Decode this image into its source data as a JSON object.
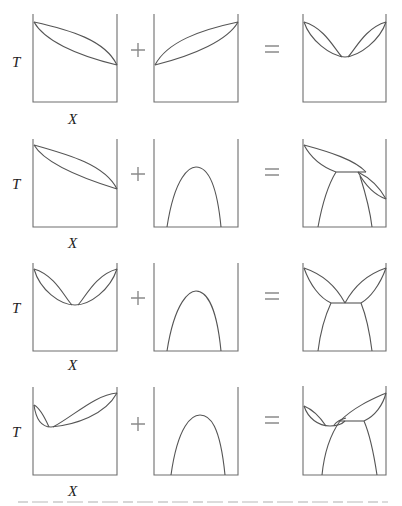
{
  "figure": {
    "type": "phase-diagram-composition",
    "axis_labels": {
      "y": "T",
      "x": "X"
    },
    "operators": {
      "plus": "+",
      "equals": "="
    },
    "rows": [
      {
        "index": 1,
        "left_panel": "lens-shaped solid-liquid diagram (ideal), high T at left, low T at right",
        "middle_panel": "lens-shaped diagram, low T at left, high T at right",
        "result_panel": "two lenses meeting at a minimum-melting (azeotrope-like) point"
      },
      {
        "index": 2,
        "left_panel": "lens-shaped solid-liquid diagram",
        "middle_panel": "solid miscibility gap (dome)",
        "result_panel": "peritectic-type diagram with miscibility gap"
      },
      {
        "index": 3,
        "left_panel": "minimum-melting diagram (two lenses)",
        "middle_panel": "solid miscibility gap (dome)",
        "result_panel": "eutectic diagram"
      },
      {
        "index": 4,
        "left_panel": "asymmetric minimum-melting diagram",
        "middle_panel": "solid miscibility gap (dome)",
        "result_panel": "asymmetric eutectic with minimum"
      }
    ],
    "caption_visible": false
  }
}
